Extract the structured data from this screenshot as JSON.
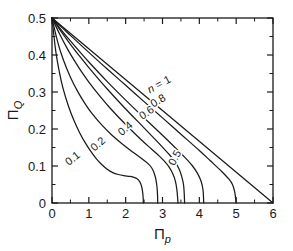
{
  "chart_data": {
    "type": "line",
    "title": "",
    "xlabel": "Πp",
    "ylabel": "ΠQ",
    "xlabel_main": "Π",
    "xlabel_sub": "p",
    "ylabel_main": "Π",
    "ylabel_sub": "Q",
    "xlim": [
      0,
      6
    ],
    "ylim": [
      0,
      0.5
    ],
    "grid": false,
    "legend_position": "inline-curve-labels",
    "xticks": [
      0,
      1,
      2,
      3,
      4,
      5,
      6
    ],
    "xtick_labels": [
      "0",
      "1",
      "2",
      "3",
      "4",
      "5",
      "6"
    ],
    "xminor_step": 0.5,
    "yticks": [
      0,
      0.1,
      0.2,
      0.3,
      0.4,
      0.5
    ],
    "ytick_labels": [
      "0",
      "0.1",
      "0.2",
      "0.3",
      "0.4",
      "0.5"
    ],
    "yminor_step": 0.05,
    "tick_direction": "in",
    "frame": "box-all-sides",
    "line_color": "#1a1a1a",
    "background_color": "#ffffff",
    "series": [
      {
        "name": "n = 1",
        "label": "n = 1",
        "label_prefix": "n",
        "label_eq": " = ",
        "label_value": "1",
        "label_rotation": -28,
        "label_x": 2.95,
        "label_y": 0.312,
        "points": [
          [
            0.0,
            0.5
          ],
          [
            6.0,
            0.0
          ]
        ]
      },
      {
        "name": "n = 0.8",
        "label": "0.8",
        "label_rotation": -31,
        "label_x": 2.93,
        "label_y": 0.268,
        "points": [
          [
            0.0,
            0.5
          ],
          [
            0.25,
            0.476
          ],
          [
            0.5,
            0.453
          ],
          [
            0.75,
            0.43
          ],
          [
            1.0,
            0.407
          ],
          [
            1.5,
            0.362
          ],
          [
            2.0,
            0.318
          ],
          [
            2.5,
            0.274
          ],
          [
            3.0,
            0.23
          ],
          [
            3.5,
            0.186
          ],
          [
            4.0,
            0.142
          ],
          [
            4.3,
            0.114
          ],
          [
            4.6,
            0.086
          ],
          [
            4.8,
            0.065
          ],
          [
            4.9,
            0.05
          ],
          [
            4.96,
            0.03
          ],
          [
            5.0,
            0.0
          ]
        ]
      },
      {
        "name": "n = 0.6",
        "label": "0.6",
        "label_rotation": -34,
        "label_x": 2.62,
        "label_y": 0.236,
        "points": [
          [
            0.0,
            0.5
          ],
          [
            0.25,
            0.468
          ],
          [
            0.5,
            0.438
          ],
          [
            0.75,
            0.409
          ],
          [
            1.0,
            0.381
          ],
          [
            1.5,
            0.328
          ],
          [
            2.0,
            0.278
          ],
          [
            2.5,
            0.23
          ],
          [
            3.0,
            0.183
          ],
          [
            3.3,
            0.154
          ],
          [
            3.6,
            0.124
          ],
          [
            3.8,
            0.102
          ],
          [
            3.95,
            0.08
          ],
          [
            4.05,
            0.058
          ],
          [
            4.1,
            0.035
          ],
          [
            4.12,
            0.0
          ]
        ]
      },
      {
        "name": "n = 0.5",
        "label": "0.5",
        "label_rotation": -63,
        "label_x": 3.42,
        "label_y": 0.118,
        "points": [
          [
            0.0,
            0.5
          ],
          [
            0.25,
            0.463
          ],
          [
            0.5,
            0.429
          ],
          [
            0.75,
            0.397
          ],
          [
            1.0,
            0.366
          ],
          [
            1.5,
            0.308
          ],
          [
            2.0,
            0.254
          ],
          [
            2.5,
            0.203
          ],
          [
            2.8,
            0.172
          ],
          [
            3.0,
            0.151
          ],
          [
            3.2,
            0.129
          ],
          [
            3.35,
            0.11
          ],
          [
            3.45,
            0.092
          ],
          [
            3.52,
            0.072
          ],
          [
            3.57,
            0.05
          ],
          [
            3.59,
            0.026
          ],
          [
            3.6,
            0.0
          ]
        ]
      },
      {
        "name": "n = 0.4",
        "label": "0.4",
        "label_rotation": -40,
        "label_x": 2.05,
        "label_y": 0.194,
        "points": [
          [
            0.0,
            0.5
          ],
          [
            0.2,
            0.458
          ],
          [
            0.4,
            0.42
          ],
          [
            0.6,
            0.386
          ],
          [
            0.8,
            0.355
          ],
          [
            1.0,
            0.327
          ],
          [
            1.3,
            0.289
          ],
          [
            1.6,
            0.254
          ],
          [
            2.0,
            0.212
          ],
          [
            2.4,
            0.173
          ],
          [
            2.7,
            0.146
          ],
          [
            2.9,
            0.128
          ],
          [
            3.05,
            0.113
          ],
          [
            3.18,
            0.097
          ],
          [
            3.28,
            0.079
          ],
          [
            3.35,
            0.059
          ],
          [
            3.39,
            0.036
          ],
          [
            3.41,
            0.015
          ],
          [
            3.42,
            0.0
          ]
        ]
      },
      {
        "name": "n = 0.2",
        "label": "0.2",
        "label_rotation": -41,
        "label_x": 1.31,
        "label_y": 0.152,
        "points": [
          [
            0.0,
            0.5
          ],
          [
            0.15,
            0.437
          ],
          [
            0.3,
            0.389
          ],
          [
            0.5,
            0.34
          ],
          [
            0.7,
            0.301
          ],
          [
            0.9,
            0.268
          ],
          [
            1.1,
            0.24
          ],
          [
            1.35,
            0.211
          ],
          [
            1.6,
            0.186
          ],
          [
            1.9,
            0.16
          ],
          [
            2.2,
            0.137
          ],
          [
            2.45,
            0.119
          ],
          [
            2.6,
            0.107
          ],
          [
            2.7,
            0.096
          ],
          [
            2.77,
            0.082
          ],
          [
            2.82,
            0.064
          ],
          [
            2.85,
            0.044
          ],
          [
            2.865,
            0.022
          ],
          [
            2.87,
            0.0
          ]
        ]
      },
      {
        "name": "n = 0.1",
        "label": "0.1",
        "label_rotation": -38,
        "label_x": 0.62,
        "label_y": 0.113,
        "points": [
          [
            0.0,
            0.5
          ],
          [
            0.1,
            0.412
          ],
          [
            0.2,
            0.354
          ],
          [
            0.3,
            0.31
          ],
          [
            0.45,
            0.261
          ],
          [
            0.6,
            0.222
          ],
          [
            0.75,
            0.19
          ],
          [
            0.9,
            0.163
          ],
          [
            1.05,
            0.14
          ],
          [
            1.2,
            0.12
          ],
          [
            1.35,
            0.104
          ],
          [
            1.5,
            0.091
          ],
          [
            1.65,
            0.082
          ],
          [
            1.8,
            0.077
          ],
          [
            1.95,
            0.074
          ],
          [
            2.1,
            0.072
          ],
          [
            2.2,
            0.07
          ],
          [
            2.3,
            0.066
          ],
          [
            2.38,
            0.058
          ],
          [
            2.43,
            0.046
          ],
          [
            2.46,
            0.03
          ],
          [
            2.475,
            0.014
          ],
          [
            2.48,
            0.0
          ]
        ]
      }
    ]
  }
}
